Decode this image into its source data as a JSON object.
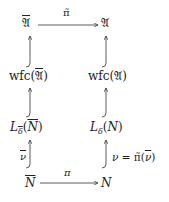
{
  "diagram": {
    "type": "commutative-diagram",
    "nodes": {
      "top_left": {
        "base": "𝔄",
        "overline": true,
        "label": "overline(𝔄)"
      },
      "top_right": {
        "base": "𝔄",
        "label": "𝔄"
      },
      "mid_left": {
        "prefix": "wfc(",
        "arg": "𝔄",
        "suffix": ")",
        "arg_overline": true
      },
      "mid_right": {
        "prefix": "wfc(",
        "arg": "𝔄",
        "suffix": ")"
      },
      "low_left": {
        "L": "L",
        "sub": "δ",
        "sub_overline": true,
        "open": "(",
        "arg": "N",
        "arg_overline": true,
        "close": ")"
      },
      "low_right": {
        "L": "L",
        "sub": "δ",
        "open": "(",
        "arg": "N",
        "close": ")"
      },
      "bottom_left": {
        "base": "N",
        "overline": true
      },
      "bottom_right": {
        "base": "N"
      }
    },
    "edges": [
      {
        "from": "top_left",
        "to": "top_right",
        "label": "π̃",
        "style": "arrow"
      },
      {
        "from": "mid_left",
        "to": "top_left",
        "style": "hook-arrow"
      },
      {
        "from": "mid_right",
        "to": "top_right",
        "style": "hook-arrow"
      },
      {
        "from": "low_left",
        "to": "mid_left",
        "style": "hook-arrow"
      },
      {
        "from": "low_right",
        "to": "mid_right",
        "style": "hook-arrow"
      },
      {
        "from": "bottom_left",
        "to": "low_left",
        "label": "ν̄",
        "style": "hook-arrow"
      },
      {
        "from": "bottom_right",
        "to": "low_right",
        "label": "ν = π̃(ν̄)",
        "style": "hook-arrow"
      },
      {
        "from": "bottom_left",
        "to": "bottom_right",
        "label": "π",
        "style": "arrow"
      }
    ],
    "labels": {
      "top_arrow": "π̃",
      "bottom_arrow": "π",
      "left_bottom_arrow": "ν",
      "right_bottom_arrow": "ν = π̃(ν̄)",
      "right_nu": "ν = ",
      "right_pi": "π̃",
      "right_arg_open": "(",
      "right_arg": "ν",
      "right_arg_close": ")"
    }
  }
}
